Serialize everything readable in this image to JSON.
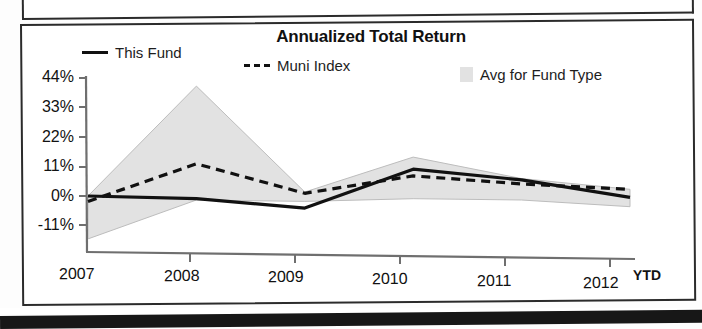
{
  "panel": {
    "title": "Annualized Total Return"
  },
  "legend": [
    {
      "label": "This Fund",
      "marker": "solid-line-swatch",
      "color": "#111111"
    },
    {
      "label": "Muni Index",
      "marker": "dashed-line-swatch",
      "color": "#111111"
    },
    {
      "label": "Avg for Fund Type",
      "marker": "shaded-band-swatch",
      "color": "#e2e2e2"
    }
  ],
  "axis": {
    "y_ticks": [
      "44%",
      "33%",
      "22%",
      "11%",
      "0%",
      "-11%"
    ],
    "x_ticks": [
      "2007",
      "2008",
      "2009",
      "2010",
      "2011",
      "2012"
    ],
    "x_suffix": "YTD"
  },
  "chart_data": {
    "type": "line",
    "title": "Annualized Total Return",
    "xlabel": "",
    "ylabel": "",
    "categories": [
      "2007",
      "2008",
      "2009",
      "2010",
      "2011",
      "2012"
    ],
    "x_tick_suffix": "YTD",
    "ylim": [
      -11,
      44
    ],
    "y_ticks": [
      -11,
      0,
      11,
      22,
      33,
      44
    ],
    "y_tick_labels": [
      "-11%",
      "0%",
      "11%",
      "22%",
      "33%",
      "44%"
    ],
    "grid": false,
    "legend_position": "top",
    "series": [
      {
        "name": "This Fund",
        "style": "solid",
        "color": "#111111",
        "values": [
          0,
          -1,
          -4.5,
          10,
          6,
          -0.5
        ]
      },
      {
        "name": "Muni Index",
        "style": "dashed",
        "color": "#111111",
        "values": [
          -2,
          12,
          1,
          7.5,
          4.5,
          2.5
        ]
      },
      {
        "name": "Avg for Fund Type",
        "style": "band",
        "color": "#e2e2e2",
        "upper": [
          0,
          41,
          1.5,
          14.5,
          6.5,
          2.5
        ],
        "lower": [
          -16,
          -1.5,
          -2,
          -1,
          -1.5,
          -4
        ]
      }
    ]
  }
}
